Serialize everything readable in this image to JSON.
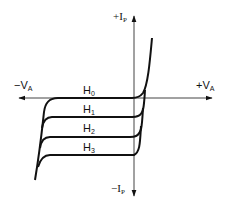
{
  "diagram": {
    "type": "iv-characteristic",
    "axes": {
      "y_positive_label": "+I",
      "y_positive_sub": "P",
      "y_negative_label": "−I",
      "y_negative_sub": "P",
      "x_negative_label": "−V",
      "x_negative_sub": "A",
      "x_positive_label": "+V",
      "x_positive_sub": "A"
    },
    "curves": [
      {
        "name": "H",
        "sub": "0"
      },
      {
        "name": "H",
        "sub": "1"
      },
      {
        "name": "H",
        "sub": "2"
      },
      {
        "name": "H",
        "sub": "3"
      }
    ],
    "colors": {
      "stroke": "#111111",
      "axis": "#444444",
      "background": "#ffffff"
    }
  }
}
